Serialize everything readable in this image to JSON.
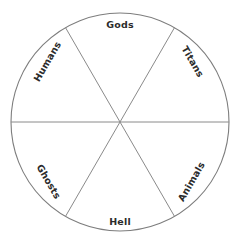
{
  "diagram": {
    "type": "wheel",
    "background_color": "#ffffff",
    "stroke_color": "#7d7d7d",
    "text_color": "#2b2b2b",
    "circle": {
      "center_x": 120,
      "center_y": 122,
      "radius": 109
    },
    "sector_count": 6,
    "sectors": [
      {
        "label": "Gods",
        "position": "top",
        "rotation_deg": 0,
        "label_x": 120,
        "label_y": 25,
        "start_angle_deg": 240,
        "end_angle_deg": 300
      },
      {
        "label": "Titans",
        "position": "upper-right",
        "rotation_deg": 60,
        "label_x": 192,
        "label_y": 62,
        "start_angle_deg": 300,
        "end_angle_deg": 360
      },
      {
        "label": "Animals",
        "position": "lower-right",
        "rotation_deg": -60,
        "label_x": 192,
        "label_y": 182,
        "start_angle_deg": 0,
        "end_angle_deg": 60
      },
      {
        "label": "Hell",
        "position": "bottom",
        "rotation_deg": 0,
        "label_x": 120,
        "label_y": 222,
        "start_angle_deg": 60,
        "end_angle_deg": 120
      },
      {
        "label": "Ghosts",
        "position": "lower-left",
        "rotation_deg": 60,
        "label_x": 48,
        "label_y": 182,
        "start_angle_deg": 120,
        "end_angle_deg": 180
      },
      {
        "label": "Humans",
        "position": "upper-left",
        "rotation_deg": -60,
        "label_x": 48,
        "label_y": 62,
        "start_angle_deg": 180,
        "end_angle_deg": 240
      }
    ],
    "divider_lines": [
      {
        "name": "horizontal-divider",
        "angle_deg": 0
      },
      {
        "name": "diagonal-divider-60",
        "angle_deg": 60
      },
      {
        "name": "diagonal-divider-120",
        "angle_deg": 120
      }
    ]
  }
}
